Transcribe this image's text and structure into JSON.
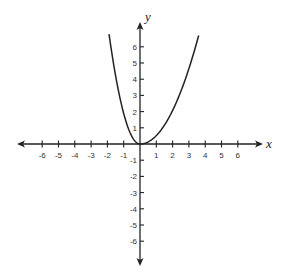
{
  "chart_data": {
    "type": "line",
    "title": "",
    "xlabel": "x",
    "ylabel": "y",
    "xlim": [
      -7,
      7
    ],
    "ylim": [
      -7,
      7
    ],
    "grid": false,
    "x_ticks": [
      -6,
      -5,
      -4,
      -3,
      -2,
      -1,
      1,
      2,
      3,
      4,
      5,
      6
    ],
    "y_ticks": [
      -6,
      -5,
      -4,
      -3,
      -2,
      -1,
      1,
      2,
      3,
      4,
      5,
      6
    ],
    "series": [
      {
        "name": "left branch (steeper, approx y = 1.9x^2)",
        "x": [
          -1.9,
          -1.6,
          -1.3,
          -1.0,
          -0.7,
          -0.4,
          0
        ],
        "y": [
          6.8,
          4.9,
          3.2,
          1.9,
          0.93,
          0.3,
          0
        ]
      },
      {
        "name": "right branch (wider, approx y = 0.52x^2)",
        "x": [
          0,
          0.5,
          1.0,
          1.5,
          2.0,
          2.5,
          3.0,
          3.6
        ],
        "y": [
          0,
          0.13,
          0.52,
          1.17,
          2.08,
          3.25,
          4.68,
          6.7
        ]
      }
    ],
    "line_color": "#222222",
    "axis_color": "#222222"
  }
}
